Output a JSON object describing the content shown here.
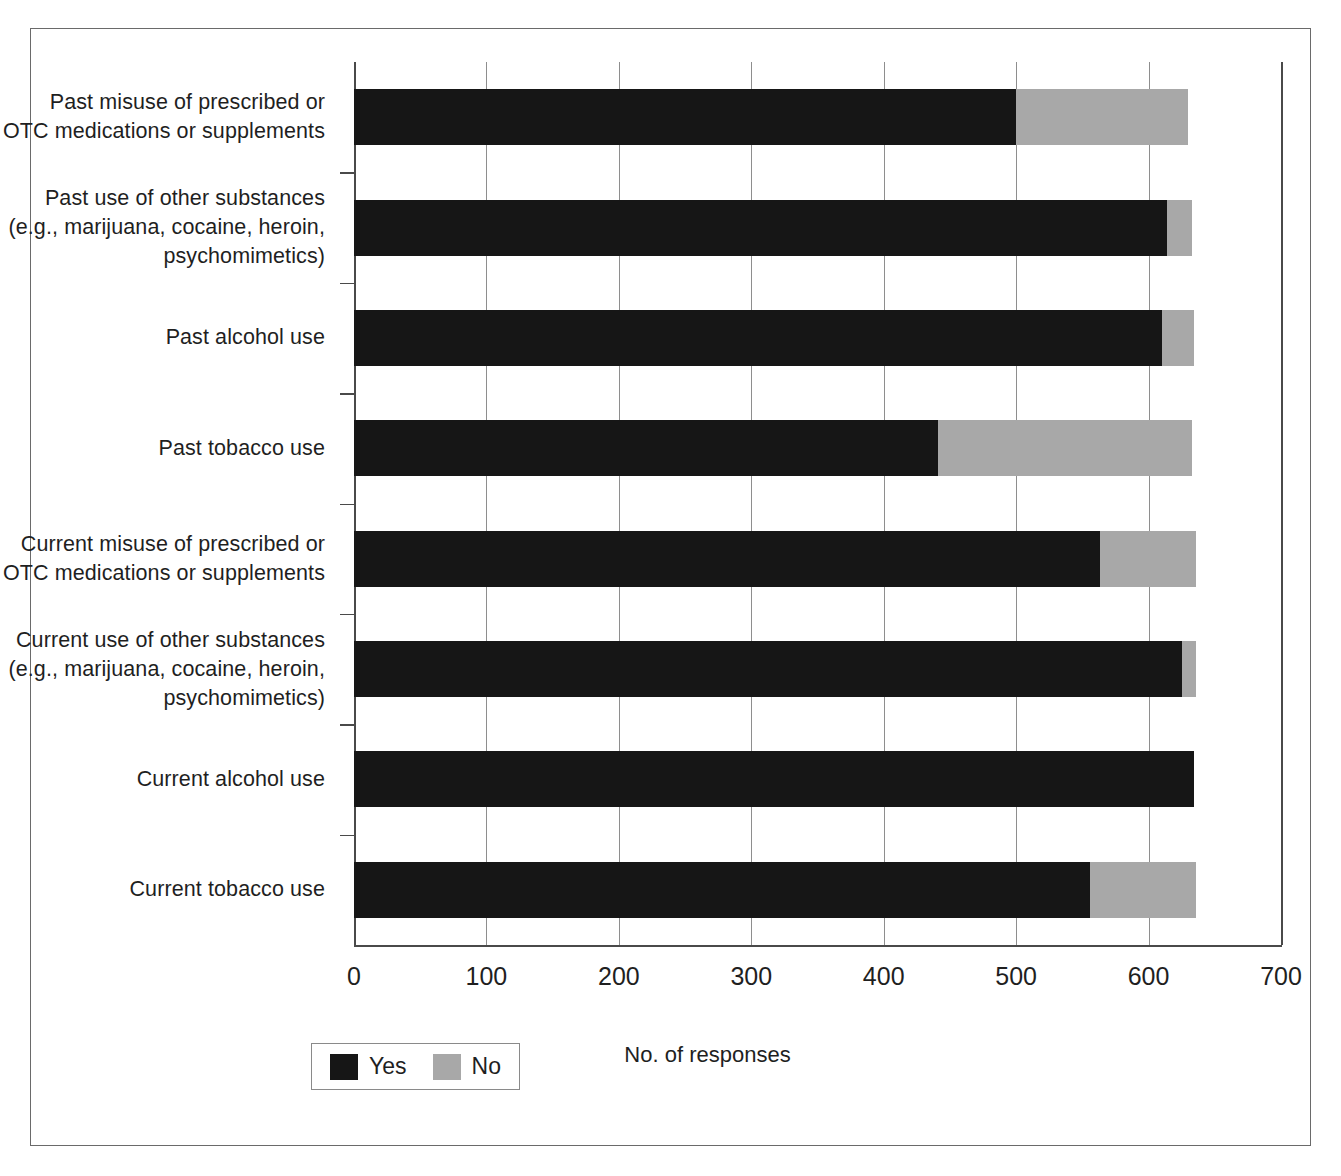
{
  "chart_data": {
    "type": "bar",
    "orientation": "horizontal",
    "stacked": true,
    "title": "",
    "xlabel": "No. of responses",
    "ylabel": "",
    "xlim": [
      0,
      700
    ],
    "xticks": [
      "0",
      "100",
      "200",
      "300",
      "400",
      "500",
      "600",
      "700"
    ],
    "grid": "vertical",
    "legend_position": "bottom-left",
    "categories": [
      "Current tobacco use",
      "Current alcohol use",
      "Current use of other substances (e.g., marijuana, cocaine, heroin, psychomimetics)",
      "Current misuse of prescribed or OTC medications or supplements",
      "Past tobacco use",
      "Past alcohol use",
      "Past use of other substances (e.g., marijuana, cocaine, heroin, psychomimetics)",
      "Past misuse of prescribed or OTC medications or supplements"
    ],
    "series": [
      {
        "name": "Yes",
        "color": "#161616",
        "values": [
          556,
          634,
          625,
          563,
          441,
          610,
          614,
          500
        ]
      },
      {
        "name": "No",
        "color": "#a8a8a8",
        "values": [
          80,
          0,
          11,
          73,
          192,
          24,
          19,
          130
        ]
      }
    ]
  },
  "axis": {
    "x_title": "No. of responses",
    "x_ticks": [
      {
        "label": "0",
        "value": 0
      },
      {
        "label": "100",
        "value": 100
      },
      {
        "label": "200",
        "value": 200
      },
      {
        "label": "300",
        "value": 300
      },
      {
        "label": "400",
        "value": 400
      },
      {
        "label": "500",
        "value": 500
      },
      {
        "label": "600",
        "value": 600
      },
      {
        "label": "700",
        "value": 700
      }
    ]
  },
  "categories": [
    {
      "id": "past-misuse-prescribed-otc",
      "lines": [
        "Past misuse of prescribed or",
        "OTC medications or supplements"
      ],
      "yes": 500,
      "no": 130
    },
    {
      "id": "past-use-other-substances",
      "lines": [
        "Past use of other substances",
        "(e.g., marijuana, cocaine, heroin,",
        "psychomimetics)"
      ],
      "yes": 614,
      "no": 19
    },
    {
      "id": "past-alcohol-use",
      "lines": [
        "Past alcohol use"
      ],
      "yes": 610,
      "no": 24
    },
    {
      "id": "past-tobacco-use",
      "lines": [
        "Past tobacco use"
      ],
      "yes": 441,
      "no": 192
    },
    {
      "id": "current-misuse-prescribed-otc",
      "lines": [
        "Current misuse of prescribed or",
        "OTC medications or supplements"
      ],
      "yes": 563,
      "no": 73
    },
    {
      "id": "current-use-other-substances",
      "lines": [
        "Current use of other substances",
        "(e.g., marijuana, cocaine, heroin,",
        "psychomimetics)"
      ],
      "yes": 625,
      "no": 11
    },
    {
      "id": "current-alcohol-use",
      "lines": [
        "Current alcohol use"
      ],
      "yes": 634,
      "no": 0
    },
    {
      "id": "current-tobacco-use",
      "lines": [
        "Current tobacco use"
      ],
      "yes": 556,
      "no": 80
    }
  ],
  "legend": {
    "entries": [
      {
        "label": "Yes",
        "color": "#161616"
      },
      {
        "label": "No",
        "color": "#a8a8a8"
      }
    ]
  },
  "colors": {
    "yes": "#161616",
    "no": "#a8a8a8",
    "grid": "#8e8e8e",
    "axis": "#4a4a4a",
    "frame": "#6a6a6a",
    "background": "#ffffff",
    "text": "#1f1f1f"
  }
}
